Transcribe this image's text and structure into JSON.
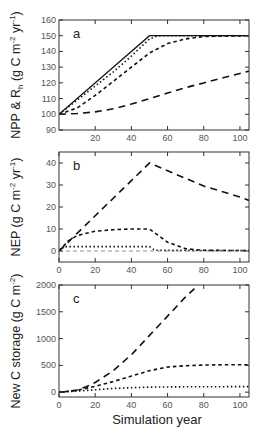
{
  "chart_data": [
    {
      "type": "line",
      "panel": "a",
      "title": "",
      "xlabel": "",
      "ylabel": "NPP & R_h (g C m^-2 yr^-1)",
      "ylabel_parts": {
        "main": "NPP & R",
        "sub": "h",
        "units_open": " (g C m",
        "sup1": "-2",
        "units_mid": " yr",
        "sup2": "-1",
        "units_close": ")"
      },
      "xlim": [
        0,
        105
      ],
      "ylim": [
        90,
        160
      ],
      "xticks": [
        20,
        40,
        60,
        80,
        100
      ],
      "yticks": [
        90,
        100,
        110,
        120,
        130,
        140,
        150,
        160
      ],
      "grid": false,
      "legend": null,
      "series": [
        {
          "name": "NPP",
          "style": "solid",
          "x": [
            0,
            50,
            105
          ],
          "values": [
            100,
            150,
            150
          ]
        },
        {
          "name": "Rh (dotted)",
          "style": "dotted",
          "x": [
            0,
            10,
            20,
            30,
            40,
            50,
            55,
            105
          ],
          "values": [
            100,
            109,
            118,
            127,
            137,
            148,
            150,
            150
          ]
        },
        {
          "name": "Rh (short dash)",
          "style": "short-dash",
          "x": [
            0,
            10,
            20,
            30,
            40,
            50,
            60,
            70,
            80,
            105
          ],
          "values": [
            100,
            104,
            112,
            121,
            130,
            139,
            145,
            148,
            149.5,
            150
          ]
        },
        {
          "name": "Rh (long dash)",
          "style": "long-dash",
          "x": [
            0,
            10,
            20,
            30,
            40,
            50,
            60,
            70,
            80,
            90,
            100,
            105
          ],
          "values": [
            100,
            100.5,
            101.5,
            103.5,
            106.5,
            110,
            113.5,
            117,
            120,
            123,
            126,
            127.5
          ]
        }
      ]
    },
    {
      "type": "line",
      "panel": "b",
      "title": "",
      "xlabel": "",
      "ylabel": "NEP (g C m^-2 yr^-1)",
      "ylabel_parts": {
        "main": "NEP",
        "units_open": " (g C m",
        "sup1": "-2",
        "units_mid": " yr",
        "sup2": "-1",
        "units_close": ")"
      },
      "xlim": [
        0,
        105
      ],
      "ylim": [
        -5,
        45
      ],
      "xticks": [
        0,
        20,
        40,
        60,
        80,
        100
      ],
      "yticks": [
        0,
        10,
        20,
        30,
        40
      ],
      "grid": false,
      "legend": null,
      "series": [
        {
          "name": "long dash",
          "style": "long-dash",
          "x": [
            0,
            10,
            20,
            30,
            40,
            50,
            60,
            70,
            80,
            90,
            100,
            105
          ],
          "values": [
            0,
            8,
            16,
            24,
            32,
            40,
            36.5,
            33,
            29.5,
            27,
            24.5,
            23
          ]
        },
        {
          "name": "short dash",
          "style": "short-dash",
          "x": [
            0,
            5,
            10,
            20,
            30,
            40,
            50,
            55,
            60,
            70,
            80,
            105
          ],
          "values": [
            0,
            4.5,
            7,
            9,
            9.7,
            10,
            10,
            7,
            4,
            1,
            0.3,
            0.2
          ]
        },
        {
          "name": "dotted",
          "style": "dotted",
          "x": [
            0,
            3,
            50,
            53,
            105
          ],
          "values": [
            0,
            2,
            2,
            0.3,
            0.2
          ]
        },
        {
          "name": "thin dash (zero)",
          "style": "thin-dash",
          "x": [
            0,
            105
          ],
          "values": [
            0,
            0
          ]
        }
      ]
    },
    {
      "type": "line",
      "panel": "c",
      "title": "",
      "xlabel": "Simulation year",
      "ylabel": "New C storage (g C m^-2)",
      "ylabel_parts": {
        "main": "New C storage",
        "units_open": " (g C m",
        "sup1": "-2",
        "units_close": ")"
      },
      "xlim": [
        0,
        105
      ],
      "ylim": [
        -90,
        2000
      ],
      "xticks": [
        0,
        20,
        40,
        60,
        80,
        100
      ],
      "yticks": [
        0,
        500,
        1000,
        1500,
        2000
      ],
      "grid": false,
      "legend": null,
      "series": [
        {
          "name": "long dash",
          "style": "long-dash",
          "x": [
            0,
            5,
            10,
            15,
            20,
            30,
            40,
            50,
            60,
            70,
            77
          ],
          "values": [
            0,
            10,
            40,
            100,
            180,
            400,
            700,
            1060,
            1420,
            1780,
            2000
          ]
        },
        {
          "name": "short dash",
          "style": "short-dash",
          "x": [
            0,
            10,
            20,
            30,
            40,
            50,
            60,
            70,
            80,
            90,
            105
          ],
          "values": [
            0,
            35,
            110,
            200,
            300,
            400,
            470,
            495,
            505,
            510,
            512
          ]
        },
        {
          "name": "dotted",
          "style": "dotted",
          "x": [
            0,
            10,
            20,
            30,
            50,
            70,
            105
          ],
          "values": [
            0,
            20,
            45,
            70,
            95,
            100,
            105
          ]
        }
      ]
    }
  ],
  "panels": {
    "a": {
      "letter": "a"
    },
    "b": {
      "letter": "b"
    },
    "c": {
      "letter": "c"
    }
  },
  "x_axis_title": "Simulation year",
  "colors": {
    "line": "#111111",
    "frame": "#333333",
    "tick_text": "#555555",
    "background": "#ffffff"
  }
}
